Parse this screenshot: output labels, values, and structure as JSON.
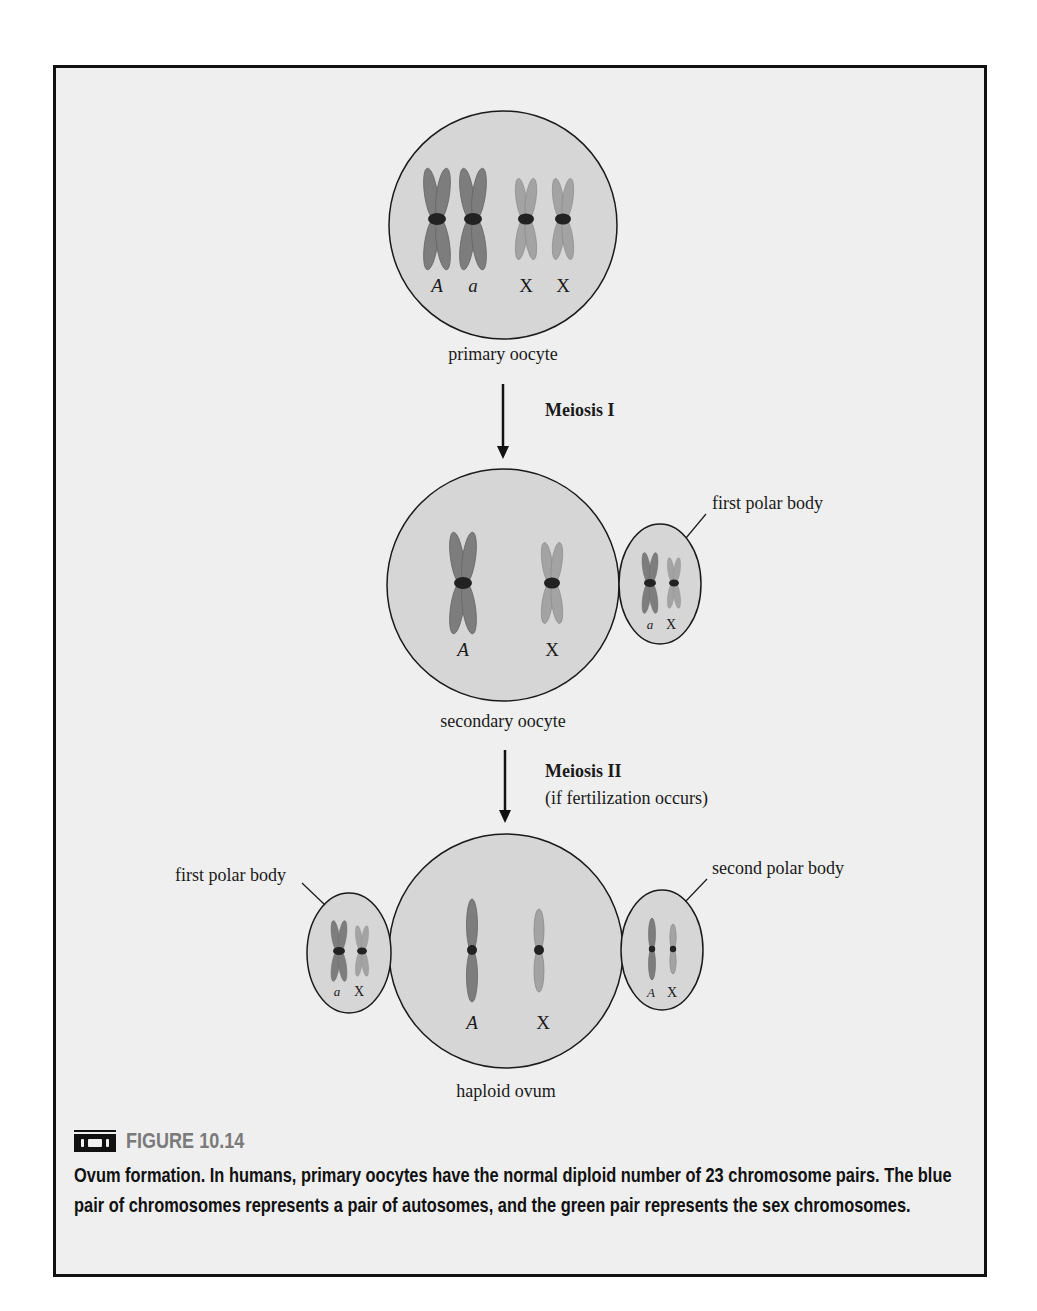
{
  "figure": {
    "number_label": "FIGURE 10.14",
    "icon": "videotape-icon",
    "caption": "Ovum formation. In humans, primary oocytes have the normal diploid number of 23 chromosome pairs. The blue pair of chromosomes represents a pair of autosomes, and the green pair represents the sex chromosomes."
  },
  "colors": {
    "autosome": "#7d7d7d",
    "sex_chromosome": "#a3a3a3",
    "cell_fill": "#d6d6d6",
    "cell_stroke": "#1a1a1a",
    "centromere": "#222222",
    "panel_bg": "#efefef"
  },
  "stages": {
    "primary": {
      "label": "primary oocyte",
      "chromosome_labels": [
        "A",
        "a",
        "X",
        "X"
      ]
    },
    "meiosis1": {
      "label": "Meiosis I"
    },
    "secondary": {
      "label": "secondary oocyte",
      "chromosome_labels": [
        "A",
        "X"
      ],
      "polar_body": {
        "label": "first polar body",
        "chromosome_labels": [
          "a",
          "X"
        ]
      }
    },
    "meiosis2": {
      "label": "Meiosis II",
      "sublabel": "(if fertilization occurs)"
    },
    "ovum": {
      "label": "haploid ovum",
      "chromosome_labels": [
        "A",
        "X"
      ],
      "first_polar_body": {
        "label": "first polar body",
        "chromosome_labels": [
          "a",
          "X"
        ]
      },
      "second_polar_body": {
        "label": "second polar body",
        "chromosome_labels": [
          "A",
          "X"
        ]
      }
    }
  }
}
